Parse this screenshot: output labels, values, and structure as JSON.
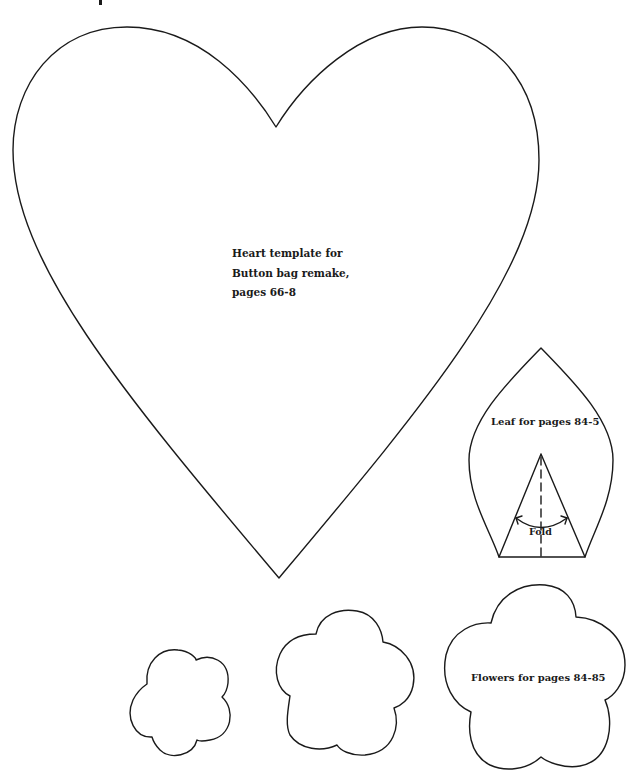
{
  "page": {
    "background": "#ffffff",
    "stroke_color": "#1a1a1a"
  },
  "templates": {
    "heart": {
      "label_lines": [
        "Heart template for",
        "Button bag remake,",
        "pages 66-8"
      ]
    },
    "leaf": {
      "label": "Leaf for pages 84-5",
      "fold_label": "Fold"
    },
    "flowers": {
      "label": "Flowers for pages 84-85",
      "sizes": [
        "small",
        "medium",
        "large"
      ]
    }
  }
}
